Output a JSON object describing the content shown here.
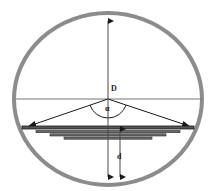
{
  "figure": {
    "type": "technical-cross-section-diagram",
    "title": "",
    "background_color": "#ffffff"
  },
  "labels": {
    "outer_diameter": "D",
    "angle": "α",
    "inner_depth": "d"
  },
  "colors": {
    "vessel_outline": "#8c8c8c",
    "plate_fill": "#555555",
    "plate_outline": "#1a1a1a",
    "dimension_line": "#1a1a1a",
    "angle_ray": "#1a1a1a",
    "horizontal_axis": "#777777",
    "label_text": "#1a1a1a"
  },
  "geometry": {
    "vessel": {
      "shape": "ellipse",
      "center_x": 108,
      "center_y": 99,
      "radius_x": 94,
      "radius_y": 86,
      "stroke_width": 4
    },
    "vertical_dimension_D": {
      "x": 108,
      "y_top": 20,
      "y_bottom": 178,
      "arrowheads": "both"
    },
    "vertical_dimension_d": {
      "x": 120,
      "y_top": 128,
      "y_bottom": 178,
      "arrowheads": "both"
    },
    "horizontal_axis": {
      "y": 99,
      "x_start": 16,
      "x_end": 202
    },
    "angle_vertex": {
      "x": 108,
      "y": 99
    },
    "angle_ray_left_end": {
      "x": 25,
      "y": 127
    },
    "angle_ray_right_end": {
      "x": 193,
      "y": 127
    },
    "angle_arc_radius": 19,
    "plates": [
      {
        "index": 1,
        "x_left": 22,
        "x_right": 194,
        "y": 127,
        "thickness": 3
      },
      {
        "index": 2,
        "x_left": 36,
        "x_right": 180,
        "y": 131,
        "thickness": 2
      },
      {
        "index": 3,
        "x_left": 50,
        "x_right": 166,
        "y": 134,
        "thickness": 2
      },
      {
        "index": 4,
        "x_left": 64,
        "x_right": 152,
        "y": 137,
        "thickness": 2
      }
    ]
  }
}
